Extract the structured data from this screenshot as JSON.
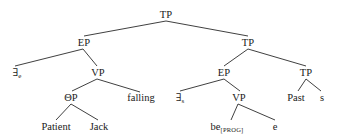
{
  "diagram": {
    "type": "syntax-tree",
    "nodes": [
      {
        "id": "tp_root",
        "label": "TP",
        "sub": "",
        "x": 166,
        "y": 15
      },
      {
        "id": "ep_left",
        "label": "EP",
        "sub": "",
        "x": 84,
        "y": 43
      },
      {
        "id": "tp_right",
        "label": "TP",
        "sub": "",
        "x": 248,
        "y": 43
      },
      {
        "id": "exists_e",
        "label": "∃",
        "sub": "e",
        "x": 17,
        "y": 73
      },
      {
        "id": "vp_left",
        "label": "VP",
        "sub": "",
        "x": 98,
        "y": 73
      },
      {
        "id": "theta_p",
        "label": "ΘP",
        "sub": "",
        "x": 71,
        "y": 98
      },
      {
        "id": "falling",
        "label": "falling",
        "sub": "",
        "x": 141,
        "y": 98
      },
      {
        "id": "patient",
        "label": "Patient",
        "sub": "",
        "x": 56,
        "y": 127
      },
      {
        "id": "jack",
        "label": "Jack",
        "sub": "",
        "x": 99,
        "y": 127
      },
      {
        "id": "ep_right",
        "label": "EP",
        "sub": "",
        "x": 224,
        "y": 73
      },
      {
        "id": "tp_lower",
        "label": "TP",
        "sub": "",
        "x": 306,
        "y": 73
      },
      {
        "id": "exists_s",
        "label": "∃",
        "sub": "s",
        "x": 180,
        "y": 98
      },
      {
        "id": "vp_right",
        "label": "VP",
        "sub": "",
        "x": 239,
        "y": 98
      },
      {
        "id": "past",
        "label": "Past",
        "sub": "",
        "x": 296,
        "y": 98
      },
      {
        "id": "s",
        "label": "s",
        "sub": "",
        "x": 322,
        "y": 98
      },
      {
        "id": "be_prog",
        "label": "be",
        "sub": "[PROG]",
        "x": 227,
        "y": 127
      },
      {
        "id": "e",
        "label": "e",
        "sub": "",
        "x": 275,
        "y": 127
      }
    ],
    "edges": [
      {
        "from": "tp_root",
        "to": "ep_left",
        "x1": 166,
        "y1": 21,
        "x2": 84,
        "y2": 36
      },
      {
        "from": "tp_root",
        "to": "tp_right",
        "x1": 166,
        "y1": 21,
        "x2": 248,
        "y2": 36
      },
      {
        "from": "ep_left",
        "to": "exists_e",
        "x1": 83,
        "y1": 49,
        "x2": 15,
        "y2": 66
      },
      {
        "from": "ep_left",
        "to": "vp_left",
        "x1": 83,
        "y1": 49,
        "x2": 97,
        "y2": 66
      },
      {
        "from": "vp_left",
        "to": "theta_p",
        "x1": 97,
        "y1": 79,
        "x2": 72,
        "y2": 91
      },
      {
        "from": "vp_left",
        "to": "falling",
        "x1": 97,
        "y1": 79,
        "x2": 140,
        "y2": 92
      },
      {
        "from": "theta_p",
        "to": "patient",
        "x1": 71,
        "y1": 104,
        "x2": 56,
        "y2": 120
      },
      {
        "from": "theta_p",
        "to": "jack",
        "x1": 71,
        "y1": 104,
        "x2": 98,
        "y2": 120
      },
      {
        "from": "tp_right",
        "to": "ep_right",
        "x1": 248,
        "y1": 49,
        "x2": 224,
        "y2": 66
      },
      {
        "from": "tp_right",
        "to": "tp_lower",
        "x1": 248,
        "y1": 49,
        "x2": 306,
        "y2": 66
      },
      {
        "from": "ep_right",
        "to": "exists_s",
        "x1": 224,
        "y1": 79,
        "x2": 180,
        "y2": 91
      },
      {
        "from": "ep_right",
        "to": "vp_right",
        "x1": 224,
        "y1": 79,
        "x2": 240,
        "y2": 91
      },
      {
        "from": "vp_right",
        "to": "be_prog",
        "x1": 238,
        "y1": 104,
        "x2": 231,
        "y2": 120
      },
      {
        "from": "vp_right",
        "to": "e",
        "x1": 238,
        "y1": 104,
        "x2": 275,
        "y2": 120
      },
      {
        "from": "tp_lower",
        "to": "past",
        "x1": 306,
        "y1": 79,
        "x2": 298,
        "y2": 91
      },
      {
        "from": "tp_lower",
        "to": "s",
        "x1": 306,
        "y1": 79,
        "x2": 321,
        "y2": 91
      }
    ]
  }
}
